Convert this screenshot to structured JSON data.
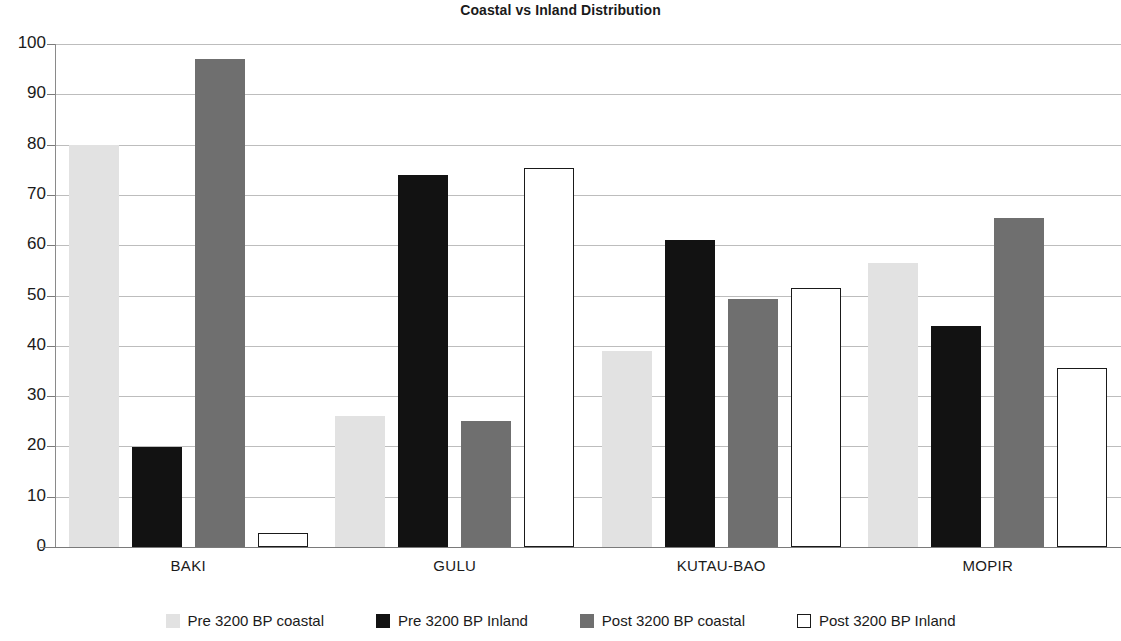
{
  "chart_data": {
    "type": "bar",
    "title": "Coastal vs Inland Distribution",
    "xlabel": "",
    "ylabel": "",
    "ylim": [
      0,
      100
    ],
    "yticks": [
      0,
      10,
      20,
      30,
      40,
      50,
      60,
      70,
      80,
      90,
      100
    ],
    "grid": true,
    "legend_position": "bottom",
    "categories": [
      "BAKI",
      "GULU",
      "KUTAU-BAO",
      "MOPIR"
    ],
    "series": [
      {
        "name": "Pre 3200 BP coastal",
        "color": "#e2e2e2",
        "values": [
          80,
          26,
          39,
          56.5
        ]
      },
      {
        "name": "Pre 3200 BP Inland",
        "color": "#121212",
        "values": [
          19.8,
          74,
          61,
          44
        ]
      },
      {
        "name": "Post 3200 BP coastal",
        "color": "#6f6f6f",
        "values": [
          97,
          25,
          49.3,
          65.5
        ]
      },
      {
        "name": "Post 3200 BP Inland",
        "color": "#ffffff",
        "values": [
          2.8,
          75.3,
          51.5,
          35.5
        ]
      }
    ]
  },
  "axis": {
    "tick_labels": [
      "100",
      "90",
      "80",
      "70",
      "60",
      "50",
      "40",
      "30",
      "20",
      "10",
      "0"
    ]
  },
  "category_labels": [
    "BAKI",
    "GULU",
    "KUTAU-BAO",
    "MOPIR"
  ],
  "legend": {
    "items": [
      {
        "label": "Pre 3200 BP coastal",
        "swatch": "light-gray-swatch-icon"
      },
      {
        "label": "Pre 3200 BP Inland",
        "swatch": "black-swatch-icon"
      },
      {
        "label": "Post 3200 BP coastal",
        "swatch": "dark-gray-swatch-icon"
      },
      {
        "label": "Post 3200 BP Inland",
        "swatch": "outline-swatch-icon"
      }
    ]
  }
}
